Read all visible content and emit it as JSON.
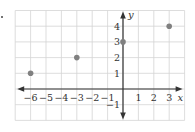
{
  "chart_data": {
    "type": "scatter",
    "title": "",
    "xlabel": "x",
    "ylabel": "y",
    "xlim": [
      -7,
      4
    ],
    "ylim": [
      -2,
      5
    ],
    "grid": true,
    "x_ticks": [
      -6,
      -5,
      -4,
      -3,
      -2,
      -1,
      1,
      2,
      3
    ],
    "y_ticks": [
      -1,
      1,
      2,
      3,
      4
    ],
    "x_tick_labels": [
      "−6",
      "−5",
      "−4",
      "−3",
      "−2",
      "−1",
      "1",
      "2",
      "3"
    ],
    "y_tick_labels": [
      "−1",
      "1",
      "2",
      "3",
      "4"
    ],
    "points": [
      {
        "x": -6,
        "y": 1
      },
      {
        "x": -3,
        "y": 2
      },
      {
        "x": 0,
        "y": 3
      },
      {
        "x": 3,
        "y": 4
      }
    ],
    "point_color": "#808080",
    "axis_color": "#333333",
    "grid_color": "#d4d4d4"
  }
}
